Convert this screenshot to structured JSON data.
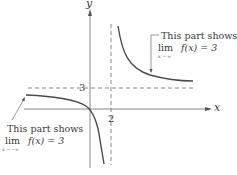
{
  "diagram": {
    "axes": {
      "x_label": "x",
      "y_label": "y"
    },
    "ticks": {
      "horizontal_asymptote_value": "3",
      "vertical_asymptote_value": "2"
    },
    "annotations": [
      {
        "id": "right",
        "line1": "This part shows",
        "lim": "lim",
        "expr": "f(x) = 3",
        "sub": "x → ∞"
      },
      {
        "id": "left",
        "line1": "This part shows",
        "lim": "lim",
        "expr": "f(x) = 3",
        "sub": "x → −∞"
      }
    ],
    "colors": {
      "curve": "#4a4a4a",
      "axis": "#6a6a6a",
      "dashed": "#6a6a6a",
      "text": "#3a3a3a"
    }
  }
}
